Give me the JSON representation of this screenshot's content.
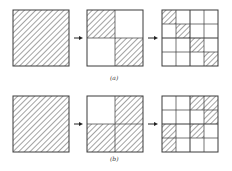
{
  "figure": {
    "rows": [
      {
        "label": "(a)",
        "panels": [
          {
            "grid": 1,
            "shaded": [
              [
                0,
                0
              ]
            ]
          },
          {
            "grid": 2,
            "shaded": [
              [
                0,
                0
              ],
              [
                1,
                1
              ]
            ]
          },
          {
            "grid": 4,
            "shaded": [
              [
                0,
                0
              ],
              [
                1,
                1
              ],
              [
                2,
                2
              ],
              [
                3,
                3
              ]
            ]
          }
        ]
      },
      {
        "label": "(b)",
        "panels": [
          {
            "grid": 1,
            "shaded": [
              [
                0,
                0
              ]
            ]
          },
          {
            "grid": 2,
            "shaded": [
              [
                0,
                1
              ],
              [
                1,
                0
              ],
              [
                1,
                1
              ]
            ]
          },
          {
            "grid": 4,
            "shaded": [
              [
                0,
                2
              ],
              [
                0,
                3
              ],
              [
                1,
                3
              ],
              [
                2,
                0
              ],
              [
                2,
                2
              ],
              [
                3,
                0
              ]
            ]
          }
        ]
      }
    ],
    "arrow_glyph": "→",
    "colors": {
      "line": "#3a3a3a",
      "hatch": "#555555",
      "background": "#ffffff"
    }
  }
}
